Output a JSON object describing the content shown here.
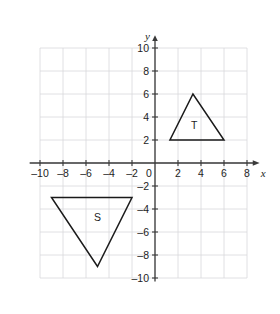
{
  "chart_data": {
    "type": "scatter",
    "title": "",
    "xlabel": "x",
    "ylabel": "y",
    "xlim": [
      -10.8,
      8.8
    ],
    "ylim": [
      -10.6,
      10.6
    ],
    "grid": true,
    "grid_step": 2,
    "legend": "none",
    "x_ticks": [
      -10,
      -8,
      -6,
      -4,
      -2,
      0,
      2,
      4,
      6,
      8
    ],
    "x_tick_labels": [
      "–10",
      "–8",
      "–6",
      "–4",
      "–2",
      "0",
      "2",
      "4",
      "6",
      "8"
    ],
    "y_ticks": [
      10,
      8,
      6,
      4,
      2,
      0,
      -2,
      -4,
      -6,
      -8,
      -10
    ],
    "y_tick_labels": [
      "10",
      "8",
      "6",
      "4",
      "2",
      "0",
      "–2",
      "–4",
      "–6",
      "–8",
      "–10"
    ],
    "shapes": [
      {
        "name": "triangle-t",
        "label": "T",
        "label_position": [
          3.4,
          3.3
        ],
        "vertices": [
          [
            1.3,
            2
          ],
          [
            6,
            2
          ],
          [
            3.3,
            6
          ]
        ]
      },
      {
        "name": "triangle-s",
        "label": "S",
        "label_position": [
          -5.0,
          -4.7
        ],
        "vertices": [
          [
            -9,
            -3
          ],
          [
            -2,
            -3
          ],
          [
            -5,
            -9
          ]
        ]
      }
    ],
    "annotations": []
  },
  "axes": {
    "x_axis_name": "x",
    "y_axis_name": "y"
  },
  "colors": {
    "grid": "#d8d8dc",
    "axis": "#3a3a3a",
    "shape_stroke": "#1a1a1a",
    "text": "#1d1d1d",
    "background": "#ffffff"
  }
}
